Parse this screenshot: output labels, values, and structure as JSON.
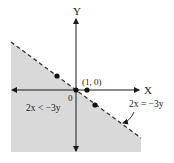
{
  "figure": {
    "type": "inequality-graph",
    "axes": {
      "x_label": "X",
      "y_label": "Y",
      "origin_label": "0"
    },
    "boundary_line": {
      "equation_label": "2x = −3y",
      "style": "dashed"
    },
    "shaded_region": {
      "inequality_label": "2x < −3y",
      "fill_color": "#d9d9d9"
    },
    "points": [
      {
        "name": "origin",
        "label": ""
      },
      {
        "name": "point-1-0",
        "label": "(1, 0)"
      },
      {
        "name": "test-point-above",
        "label": ""
      },
      {
        "name": "test-point-below",
        "label": ""
      }
    ],
    "colors": {
      "axis": "#1a1a1a",
      "line": "#333333",
      "shade": "#d9d9d9"
    }
  }
}
